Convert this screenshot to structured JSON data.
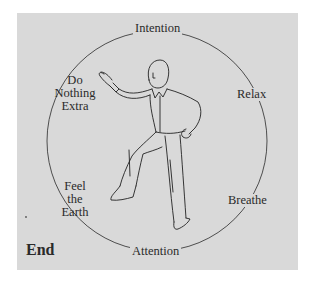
{
  "diagram": {
    "center_figure": "tai-chi-figure-line-drawing",
    "labels": {
      "top": "Intention",
      "right_upper": "Relax",
      "right_lower": "Breathe",
      "bottom": "Attention",
      "left_upper": [
        "Do",
        "Nothing",
        "Extra"
      ],
      "left_lower": [
        "Feel",
        "the",
        "Earth"
      ],
      "corner": "End"
    },
    "colors": {
      "panel": "#d9d9d9",
      "ink": "#2a2a2a"
    }
  }
}
